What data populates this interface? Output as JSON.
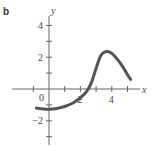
{
  "panel_label": "b",
  "chart_data": {
    "type": "line",
    "title": "",
    "xlabel": "x",
    "ylabel": "y",
    "xlim": [
      -1.2,
      5.8
    ],
    "ylim": [
      -3.2,
      4.6
    ],
    "x_ticks": [
      -1,
      0,
      1,
      2,
      3,
      4,
      5
    ],
    "y_ticks": [
      -3,
      -2,
      -1,
      0,
      1,
      2,
      3,
      4
    ],
    "x_tick_labels": {
      "0": "0",
      "2": "2",
      "4": "4"
    },
    "y_tick_labels": {
      "-2": "−2",
      "2": "2",
      "4": "4"
    },
    "grid": false,
    "series": [
      {
        "name": "curve",
        "x": [
          -0.8,
          -0.4,
          0,
          0.5,
          1,
          1.5,
          2,
          2.4,
          2.7,
          3.0,
          3.3,
          3.6,
          3.9,
          4.2,
          4.6,
          5.0,
          5.2
        ],
        "y": [
          -1.2,
          -1.25,
          -1.27,
          -1.22,
          -1.1,
          -0.9,
          -0.55,
          -0.15,
          0.4,
          1.3,
          2.1,
          2.35,
          2.3,
          2.05,
          1.55,
          0.9,
          0.6
        ]
      }
    ],
    "color": "#555555"
  }
}
